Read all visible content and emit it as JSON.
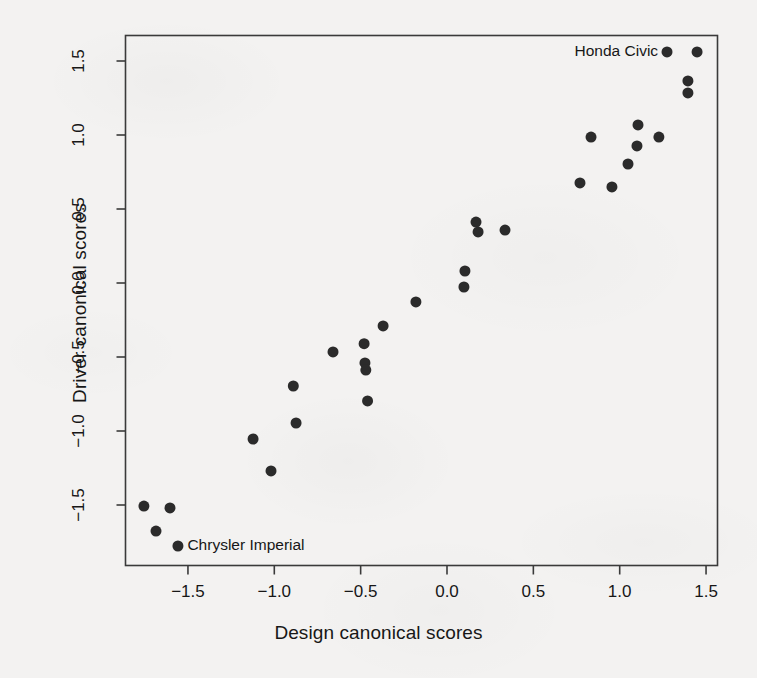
{
  "chart_data": {
    "type": "scatter",
    "title": "",
    "xlabel": "Design canonical scores",
    "ylabel": "Driver canonical scores",
    "xlim": [
      -1.92,
      1.58
    ],
    "ylim": [
      -1.92,
      1.68
    ],
    "xticks": [
      -1.5,
      -1.0,
      -0.5,
      0.0,
      0.5,
      1.0,
      1.5
    ],
    "xticklabels": [
      "-1.5",
      "-1.0",
      "-0.5",
      "0.0",
      "0.5",
      "1.0",
      "1.5"
    ],
    "yticks": [
      -1.5,
      -1.0,
      -0.5,
      0.0,
      0.5,
      1.0,
      1.5
    ],
    "yticklabels": [
      "-1.5",
      "-1.0",
      "-0.5",
      "0.0",
      "0.5",
      "1.0",
      "1.5"
    ],
    "grid": false,
    "legend": null,
    "marker": "filled-circle",
    "marker_color": "#2b2b2b",
    "marker_size": 11,
    "points": [
      {
        "x": -1.755,
        "y": -1.507
      },
      {
        "x": -1.604,
        "y": -1.52
      },
      {
        "x": -1.685,
        "y": -1.676
      },
      {
        "x": -1.558,
        "y": -1.777
      },
      {
        "x": -1.123,
        "y": -1.054
      },
      {
        "x": -1.019,
        "y": -1.27
      },
      {
        "x": -0.89,
        "y": -0.696
      },
      {
        "x": -0.874,
        "y": -0.946
      },
      {
        "x": -0.66,
        "y": -0.466
      },
      {
        "x": -0.48,
        "y": -0.41
      },
      {
        "x": -0.475,
        "y": -0.54
      },
      {
        "x": -0.47,
        "y": -0.588
      },
      {
        "x": -0.46,
        "y": -0.797
      },
      {
        "x": -0.37,
        "y": -0.29
      },
      {
        "x": -0.18,
        "y": -0.128
      },
      {
        "x": 0.104,
        "y": 0.081
      },
      {
        "x": 0.098,
        "y": -0.027
      },
      {
        "x": 0.168,
        "y": 0.412
      },
      {
        "x": 0.18,
        "y": 0.345
      },
      {
        "x": 0.336,
        "y": 0.358
      },
      {
        "x": 0.77,
        "y": 0.676
      },
      {
        "x": 0.834,
        "y": 0.986
      },
      {
        "x": 0.955,
        "y": 0.649
      },
      {
        "x": 1.048,
        "y": 0.804
      },
      {
        "x": 1.1,
        "y": 0.926
      },
      {
        "x": 1.106,
        "y": 1.068
      },
      {
        "x": 1.227,
        "y": 0.986
      },
      {
        "x": 1.274,
        "y": 1.561
      },
      {
        "x": 1.395,
        "y": 1.365
      },
      {
        "x": 1.395,
        "y": 1.284
      },
      {
        "x": 1.448,
        "y": 1.561
      }
    ],
    "annotations": [
      {
        "text": "Honda Civic",
        "x": 1.274,
        "y": 1.561,
        "align": "right"
      },
      {
        "text": "Chrysler Imperial",
        "x": -1.558,
        "y": -1.777,
        "align": "left"
      }
    ]
  },
  "axis": {
    "x_title": "Design canonical scores",
    "y_title": "Driver canonical scores"
  }
}
